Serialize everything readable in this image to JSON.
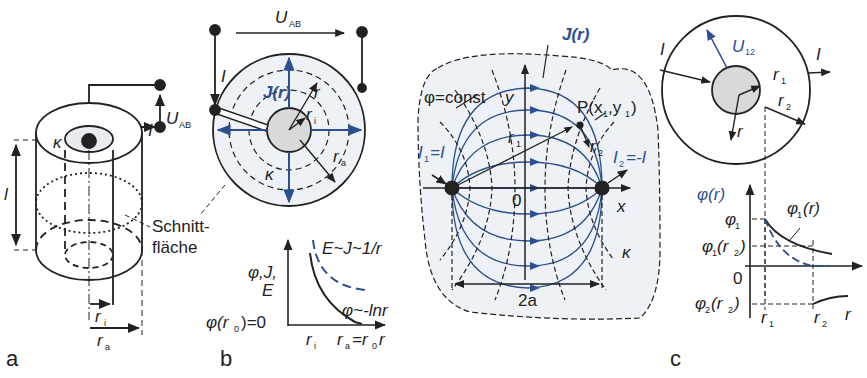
{
  "panels": {
    "a": {
      "panel_label": "a",
      "kappa": "κ",
      "length": "l",
      "current": "I",
      "voltage": "U",
      "voltage_sub": "AB",
      "section_line1": "Schnitt-",
      "section_line2": "fläche",
      "r_inner": "r",
      "r_inner_sub": "i",
      "r_outer": "r",
      "r_outer_sub": "a"
    },
    "b": {
      "panel_label": "b",
      "voltage": "U",
      "voltage_sub": "AB",
      "current": "I",
      "current_density": "J(r)",
      "r": "r",
      "r_i": "r",
      "r_i_sub": "i",
      "r_a": "r",
      "r_a_sub": "a",
      "kappa": "κ",
      "graph": {
        "y_label_line1": "φ,J,",
        "y_label_line2": "E",
        "y_zero": "φ(r",
        "y_zero_sub": "0",
        "y_zero_tail": ")=0",
        "curve_E": "E~J~1/r",
        "curve_phi": "φ~-lnr",
        "x_ri": "r",
        "x_ri_sub": "i",
        "x_ra": "r",
        "x_ra_sub": "a",
        "x_eq": "=r",
        "x_eq_sub": "0",
        "x_axis": "r"
      }
    },
    "middle": {
      "current_density": "J(r)",
      "phi_const": "φ=const",
      "y_axis": "y",
      "x_axis": "x",
      "origin": "0",
      "point": "P(x",
      "point_sub1": "1",
      "point_mid": ",y",
      "point_sub2": "1",
      "point_end": ")",
      "r1": "r",
      "r1_sub": "1",
      "r2": "r",
      "r2_sub": "2",
      "I1": "I",
      "I1_sub": "1",
      "I1_val": "=I",
      "I2": "I",
      "I2_sub": "2",
      "I2_val": "=-I",
      "kappa": "κ",
      "distance": "2a"
    },
    "c": {
      "panel_label": "c",
      "current_in": "I",
      "current_out": "I",
      "voltage": "U",
      "voltage_sub": "12",
      "r1": "r",
      "r1_sub": "1",
      "r2": "r",
      "r2_sub": "2",
      "r": "r",
      "graph": {
        "y_axis": "φ(r)",
        "phi1": "φ",
        "phi1_sub": "1",
        "phi1_r2": "φ",
        "phi1_r2_sub": "1",
        "phi1_r2_tail": "(r",
        "phi1_r2_sub2": "2",
        "phi1_r2_end": ")",
        "zero": "0",
        "phi2_r2": "φ",
        "phi2_r2_sub": "2",
        "phi2_r2_tail": "(r",
        "phi2_r2_sub2": "2",
        "phi2_r2_end": ")",
        "curve": "φ",
        "curve_sub": "1",
        "curve_tail": "(r)",
        "x_r1": "r",
        "x_r1_sub": "1",
        "x_r2": "r",
        "x_r2_sub": "2",
        "x_axis": "r"
      }
    }
  },
  "colors": {
    "line": "#222222",
    "blue": "#2c4f8f",
    "fill_light": "#eef2f6",
    "fill_core": "#d9d9d9"
  }
}
